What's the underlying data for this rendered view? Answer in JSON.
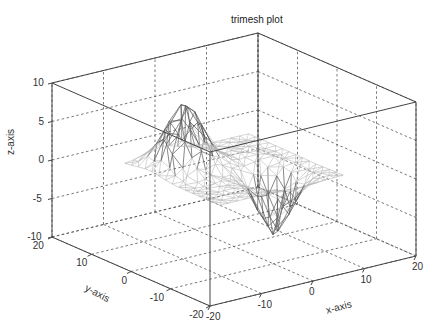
{
  "chart_data": {
    "type": "surface-trimesh",
    "title": "trimesh plot",
    "xlabel": "x-axis",
    "ylabel": "y-axis",
    "zlabel": "z-axis",
    "xlim": [
      -20,
      20
    ],
    "ylim": [
      -20,
      20
    ],
    "zlim": [
      -10,
      10
    ],
    "xticks": [
      -20,
      -10,
      0,
      10,
      20
    ],
    "yticks": [
      -20,
      -10,
      0,
      10,
      20
    ],
    "zticks": [
      -10,
      -5,
      0,
      5,
      10
    ],
    "xtick_labels": [
      "-20",
      "-10",
      "0",
      "10",
      "20"
    ],
    "ytick_labels": [
      "-20",
      "-10",
      "0",
      "10",
      "20"
    ],
    "ztick_labels": [
      "-10",
      "-5",
      "0",
      "5",
      "10"
    ],
    "grid": true,
    "grid_style": "dashed",
    "box": true,
    "mesh_color": "#b8b8b8",
    "mesh_dark_color": "#555555",
    "axis_color": "#444444",
    "surface": {
      "description": "Triangulated surface with a positive peak near (x=-5, y=5) reaching ~8 and a negative trough near (x=3, y=-5) reaching ~-8; flat near z=0 elsewhere over x,y in [-12,12].",
      "peak": {
        "x": -5,
        "y": 6,
        "z": 8
      },
      "trough": {
        "x": 4,
        "y": -5,
        "z": -8
      },
      "extent": [
        -12,
        12
      ]
    }
  }
}
